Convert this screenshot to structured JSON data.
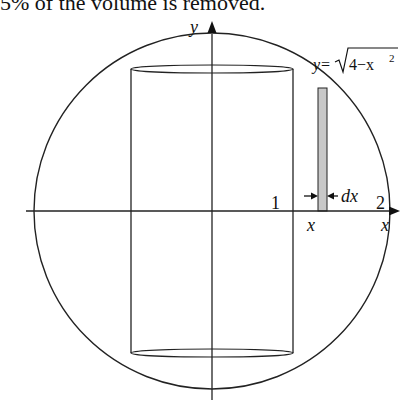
{
  "caption": "5% of the volume is removed.",
  "figure": {
    "axes": {
      "x_label": "x",
      "y_label": "y"
    },
    "curve_label": {
      "prefix": "y=",
      "radicand": "4−x",
      "exponent": "2"
    },
    "tick_labels": {
      "one": "1",
      "two": "2"
    },
    "strip": {
      "position_label": "x",
      "width_label": "dx",
      "fill": "#c8c8c8"
    },
    "colors": {
      "stroke": "#222222",
      "background": "#ffffff"
    }
  }
}
